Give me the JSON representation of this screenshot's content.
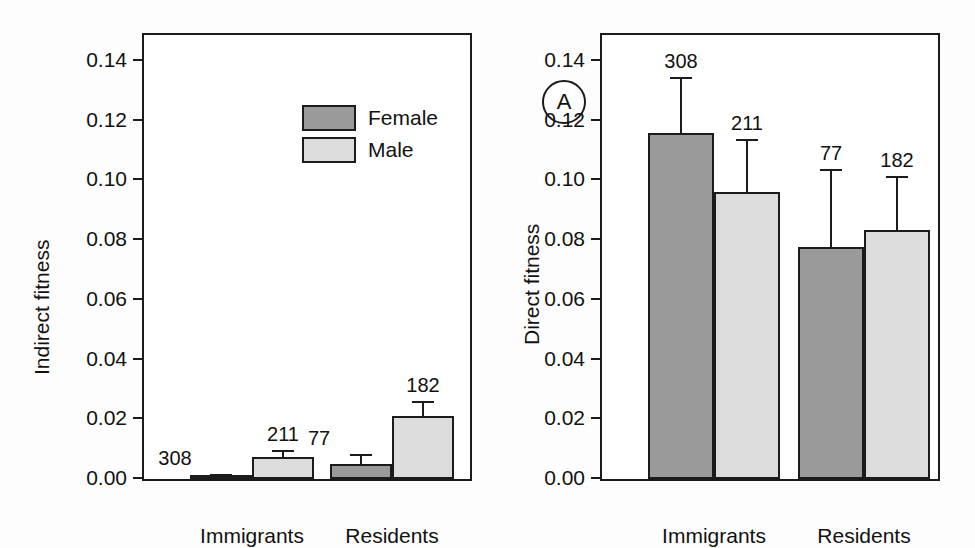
{
  "figure": {
    "background": "#ffffff",
    "female_color": "#9a9a9a",
    "male_color": "#dcdcdc",
    "axis_color": "#1b1b1b"
  },
  "legend": {
    "position": "top-left-panel-a",
    "entries": [
      {
        "label": "Female",
        "color": "#9a9a9a"
      },
      {
        "label": "Male",
        "color": "#dcdcdc"
      }
    ]
  },
  "panels": [
    {
      "letter": "A",
      "ylabel": "Indirect fitness"
    },
    {
      "letter": "B",
      "ylabel": "Direct fitness"
    }
  ],
  "axis": {
    "ticks": [
      "0.14",
      "0.12",
      "0.10",
      "0.08",
      "0.06",
      "0.04",
      "0.02",
      "0.00"
    ],
    "categories": [
      "Immigrants",
      "Residents"
    ]
  },
  "chart_data": [
    {
      "type": "bar",
      "panel": "A",
      "title": "",
      "xlabel": "",
      "ylabel": "Indirect fitness",
      "ylim": [
        0.0,
        0.15
      ],
      "yticks": [
        0.0,
        0.02,
        0.04,
        0.06,
        0.08,
        0.1,
        0.12,
        0.14
      ],
      "ytick_labels": [
        "0.00",
        "0.02",
        "0.04",
        "0.06",
        "0.08",
        "0.10",
        "0.12",
        "0.14"
      ],
      "grid": false,
      "legend": [
        "Female",
        "Male"
      ],
      "categories": [
        "Immigrants",
        "Residents"
      ],
      "series": [
        {
          "name": "Female",
          "color": "#9a9a9a",
          "values": [
            0.0005,
            0.0051
          ],
          "errors": [
            0.0004,
            0.0025
          ],
          "annotations": [
            "308",
            "77"
          ]
        },
        {
          "name": "Male",
          "color": "#dcdcdc",
          "values": [
            0.0074,
            0.0212
          ],
          "errors": [
            0.0015,
            0.0041
          ],
          "annotations": [
            "211",
            "182"
          ]
        }
      ]
    },
    {
      "type": "bar",
      "panel": "B",
      "title": "",
      "xlabel": "",
      "ylabel": "Direct fitness",
      "ylim": [
        0.0,
        0.15
      ],
      "yticks": [
        0.0,
        0.02,
        0.04,
        0.06,
        0.08,
        0.1,
        0.12,
        0.14
      ],
      "ytick_labels": [
        "0.00",
        "0.02",
        "0.04",
        "0.06",
        "0.08",
        "0.10",
        "0.12",
        "0.14"
      ],
      "grid": false,
      "legend": [
        "Female",
        "Male"
      ],
      "categories": [
        "Immigrants",
        "Residents"
      ],
      "series": [
        {
          "name": "Female",
          "color": "#9a9a9a",
          "values": [
            0.116,
            0.0776
          ],
          "errors": [
            0.0178,
            0.0256
          ],
          "annotations": [
            "308",
            "77"
          ]
        },
        {
          "name": "Male",
          "color": "#dcdcdc",
          "values": [
            0.0961,
            0.0833
          ],
          "errors": [
            0.017,
            0.0175
          ],
          "annotations": [
            "211",
            "182"
          ]
        }
      ]
    }
  ]
}
